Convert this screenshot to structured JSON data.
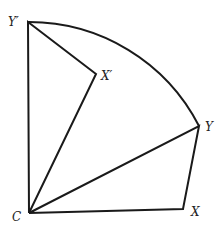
{
  "diagram": {
    "type": "geometric-rotation",
    "labels": {
      "C": "C",
      "X": "X",
      "Y": "Y",
      "X_prime": "X′",
      "Y_prime": "Y′"
    },
    "points": {
      "C": [
        29,
        213
      ],
      "X": [
        183,
        209
      ],
      "Y": [
        199,
        126
      ],
      "X_prime": [
        96,
        74
      ],
      "Y_prime": [
        28,
        22
      ]
    },
    "segments": [
      [
        "C",
        "X"
      ],
      [
        "X",
        "Y"
      ],
      [
        "C",
        "Y"
      ],
      [
        "C",
        "Y_prime"
      ],
      [
        "Y_prime",
        "X_prime"
      ],
      [
        "X_prime",
        "C"
      ]
    ],
    "arcs": [
      {
        "center": "C",
        "from": "Y_prime",
        "to": "Y"
      }
    ],
    "stroke_color": "#1a1a1a",
    "background": "#ffffff"
  }
}
